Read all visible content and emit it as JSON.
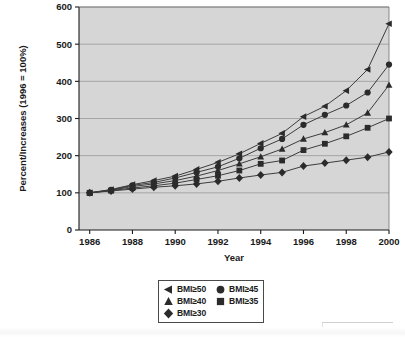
{
  "chart_data": {
    "type": "line",
    "title": "",
    "subtitle": "",
    "xlabel": "Year",
    "ylabel": "Percent/Increases (1996 = 100%)",
    "x": [
      1986,
      1987,
      1988,
      1989,
      1990,
      1991,
      1992,
      1993,
      1994,
      1995,
      1996,
      1997,
      1998,
      1999,
      2000
    ],
    "xlim": [
      1985.5,
      2000
    ],
    "ylim": [
      0,
      600
    ],
    "xtick_labels": [
      "1986",
      "1988",
      "1990",
      "1992",
      "1994",
      "1996",
      "1998",
      "2000"
    ],
    "xtick_values": [
      1986,
      1988,
      1990,
      1992,
      1994,
      1996,
      1998,
      2000
    ],
    "ytick_labels": [
      "0",
      "100",
      "200",
      "300",
      "400",
      "500",
      "600"
    ],
    "ytick_values": [
      0,
      100,
      200,
      300,
      400,
      500,
      600
    ],
    "grid": "horizontal",
    "legend_position": "bottom-center",
    "plot_background": "#d6d6d6",
    "line_color": "#3c3c3c",
    "marker_color": "#2b2b2b",
    "series": [
      {
        "name": "BMI≥50",
        "marker": "left-triangle",
        "values": [
          100,
          109,
          122,
          133,
          145,
          163,
          182,
          205,
          233,
          260,
          305,
          333,
          375,
          432,
          555
        ]
      },
      {
        "name": "BMI≥45",
        "marker": "circle",
        "values": [
          100,
          108,
          120,
          128,
          140,
          155,
          170,
          193,
          220,
          245,
          283,
          310,
          335,
          370,
          445
        ]
      },
      {
        "name": "BMI≥40",
        "marker": "triangle",
        "values": [
          100,
          107,
          117,
          124,
          133,
          145,
          160,
          178,
          197,
          218,
          245,
          262,
          283,
          315,
          390
        ]
      },
      {
        "name": "BMI≥35",
        "marker": "square",
        "values": [
          100,
          106,
          113,
          119,
          126,
          136,
          146,
          160,
          178,
          187,
          215,
          232,
          252,
          275,
          300
        ]
      },
      {
        "name": "BMI≥30",
        "marker": "diamond",
        "values": [
          100,
          105,
          110,
          115,
          119,
          124,
          131,
          140,
          148,
          155,
          172,
          180,
          188,
          196,
          210
        ]
      }
    ]
  },
  "legend": {
    "entries": [
      {
        "label": "BMI≥50",
        "marker": "left-triangle"
      },
      {
        "label": "BMI≥45",
        "marker": "circle"
      },
      {
        "label": "BMI≥40",
        "marker": "triangle"
      },
      {
        "label": "BMI≥35",
        "marker": "square"
      },
      {
        "label": "BMI≥30",
        "marker": "diamond"
      }
    ]
  }
}
